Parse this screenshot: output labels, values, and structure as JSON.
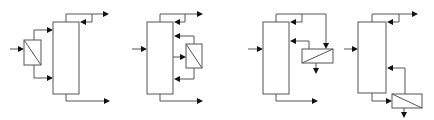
{
  "figure": {
    "stroke_color": "#555555",
    "arrow_color": "#111111",
    "background": "#ffffff"
  },
  "diagrams": [
    {
      "id": "config-1",
      "exchanger_position": "feed-preheater",
      "exchanger_diagonal": "top-left-to-bottom-right"
    },
    {
      "id": "config-2",
      "exchanger_position": "side-heater-pumparound",
      "exchanger_diagonal": "top-left-to-bottom-right"
    },
    {
      "id": "config-3",
      "exchanger_position": "overhead-side-condenser",
      "exchanger_diagonal": "bottom-left-to-top-right"
    },
    {
      "id": "config-4",
      "exchanger_position": "bottoms-reboiler",
      "exchanger_diagonal": "top-left-to-bottom-right"
    }
  ]
}
